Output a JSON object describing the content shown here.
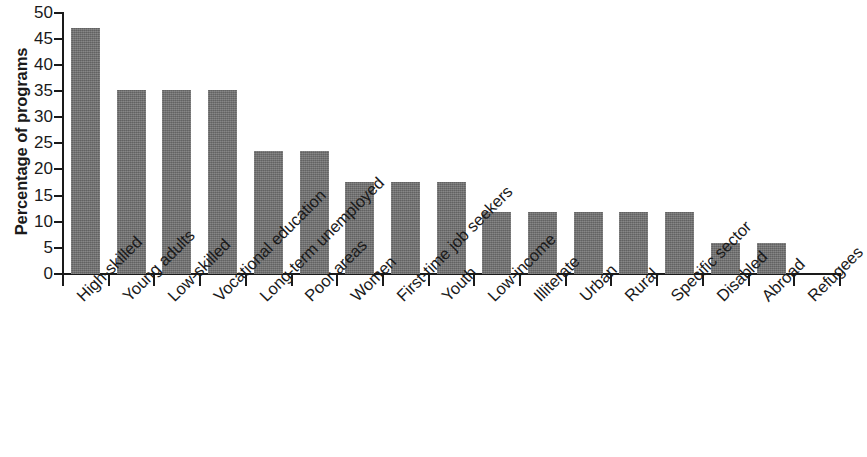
{
  "chart_data": {
    "type": "bar",
    "title": "",
    "subtitle": "",
    "xlabel": "",
    "ylabel": "Percentage of programs",
    "ylim": [
      0,
      50
    ],
    "ytick_step": 5,
    "ytick_labels": [
      "50",
      "45",
      "40",
      "35",
      "30",
      "25",
      "20",
      "15",
      "10",
      "5",
      "0"
    ],
    "ytick_values": [
      50,
      45,
      40,
      35,
      30,
      25,
      20,
      15,
      10,
      5,
      0
    ],
    "grid": false,
    "legend": null,
    "bar_color": "#6f6f6f",
    "axis_color": "#1a1a1a",
    "background_color": "#ffffff",
    "label_rotation_degrees": -45,
    "categories": [
      "High-skilled",
      "Young adults",
      "Low-skilled",
      "Vocational education",
      "Long-term unemployed",
      "Poor areas",
      "Women",
      "First-time job seekers",
      "Youth",
      "Low-income",
      "Illiterate",
      "Urban",
      "Rural",
      "Specific sector",
      "Disabled",
      "Abroad",
      "Refugees"
    ],
    "values": [
      47.1,
      35.3,
      35.3,
      35.3,
      23.5,
      23.5,
      17.6,
      17.6,
      17.6,
      11.8,
      11.8,
      11.8,
      11.8,
      11.8,
      5.9,
      5.9,
      0
    ]
  }
}
